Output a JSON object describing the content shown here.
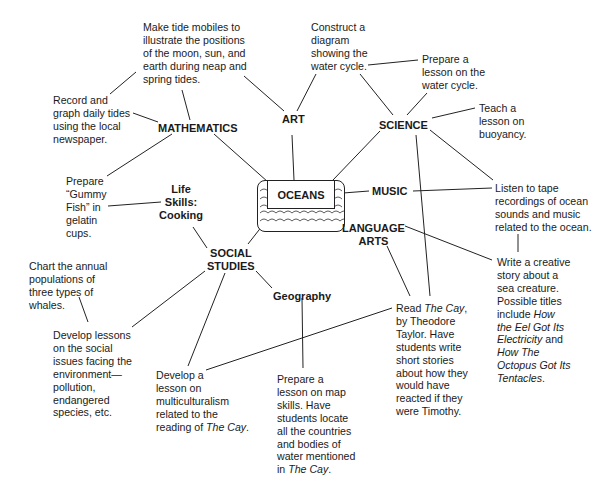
{
  "center": {
    "label": "OCEANS"
  },
  "topics": {
    "mathematics": "MATHEMATICS",
    "art": "ART",
    "science": "SCIENCE",
    "music": "MUSIC",
    "language_arts": "LANGUAGE\nARTS",
    "life_skills": "Life\nSkills:\nCooking",
    "social_studies": "SOCIAL\nSTUDIES",
    "geography": "Geography"
  },
  "activities": {
    "tide_mobiles": "Make tide mobiles to\nillustrate the positions\nof the moon, sun, and\nearth during neap and\nspring tides.",
    "record_tides": "Record and\ngraph daily tides\nusing the local\nnewspaper.",
    "water_cycle_diagram": "Construct a\ndiagram\nshowing the\nwater cycle.",
    "water_cycle_lesson": "Prepare a\nlesson on the\nwater cycle.",
    "buoyancy": "Teach a\nlesson on\nbuoyancy.",
    "gummy_fish": "Prepare\n“Gummy\nFish” in\ngelatin\ncups.",
    "ocean_sounds": "Listen to tape\nrecordings of ocean\nsounds and music\nrelated to the ocean.",
    "whales": "Chart the annual\npopulations of\nthree types of\nwhales.",
    "social_issues": "Develop lessons\non the social\nissues facing the\nenvironment—\npollution,\nendangered\nspecies, etc.",
    "multiculturalism": {
      "text": "Develop a\nlesson on\nmulticulturalism\nrelated to the\nreading of ",
      "title": "The Cay",
      "end": "."
    },
    "map_skills": {
      "text": "Prepare a\nlesson on map\nskills. Have\nstudents locate\nall the countries\nand bodies of\nwater mentioned\nin ",
      "title": "The Cay",
      "end": "."
    },
    "read_cay": {
      "pre": "Read ",
      "title": "The Cay",
      "text": ",\nby Theodore\nTaylor. Have\nstudents write\nshort stories\nabout how they\nwould have\nreacted if they\nwere Timothy."
    },
    "creative_story": {
      "text": "Write a creative\nstory about a\nsea creature.\nPossible titles\ninclude ",
      "title1": "How\nthe Eel Got Its\nElectricity",
      "mid": " and\n",
      "title2": "How The\nOctopus Got Its\nTentacles",
      "end": "."
    }
  }
}
